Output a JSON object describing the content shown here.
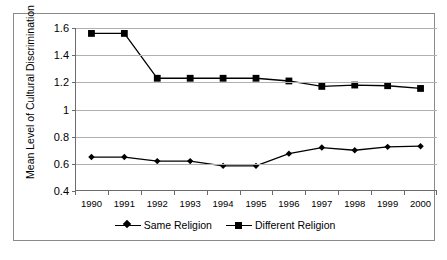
{
  "chart_data": {
    "type": "line",
    "title": "",
    "xlabel": "",
    "ylabel": "Mean Level of Cultural Discrimination",
    "categories": [
      "1990",
      "1991",
      "1992",
      "1993",
      "1994",
      "1995",
      "1996",
      "1997",
      "1998",
      "1999",
      "2000"
    ],
    "ylim": [
      0.4,
      1.6
    ],
    "yticks": [
      "0.4",
      "0.6",
      "0.8",
      "1",
      "1.2",
      "1.4",
      "1.6"
    ],
    "ytick_values": [
      0.4,
      0.6,
      0.8,
      1.0,
      1.2,
      1.4,
      1.6
    ],
    "grid": true,
    "legend_position": "bottom",
    "series": [
      {
        "name": "Same Religion",
        "marker": "diamond",
        "color": "#000000",
        "values": [
          0.65,
          0.65,
          0.62,
          0.62,
          0.585,
          0.585,
          0.675,
          0.72,
          0.7,
          0.725,
          0.73
        ]
      },
      {
        "name": "Different Religion",
        "marker": "square",
        "color": "#000000",
        "values": [
          1.56,
          1.56,
          1.23,
          1.23,
          1.23,
          1.23,
          1.21,
          1.17,
          1.18,
          1.175,
          1.155
        ]
      }
    ]
  },
  "legend": {
    "entries": [
      {
        "label": "Same Religion"
      },
      {
        "label": "Different Religion"
      }
    ]
  },
  "colors": {
    "series": "#000000",
    "gridline": "#b0b0b0",
    "axis": "#6b6b6b",
    "border": "#8a8a8a",
    "background": "#ffffff"
  }
}
